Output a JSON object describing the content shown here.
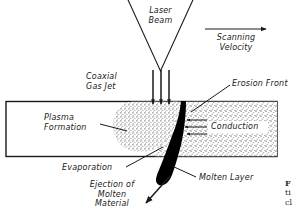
{
  "figure": {
    "type": "technical-schematic",
    "background_color": "#ffffff",
    "line_color": "#1a1a1a",
    "fill_molten_color": "#000000",
    "fill_stipple_color": "#b9b9b9",
    "labels": {
      "laser_beam": "Laser\nBeam",
      "laser_beam_line1": "Laser",
      "laser_beam_line2": "Beam",
      "scanning_velocity_line1": "Scanning",
      "scanning_velocity_line2": "Velocity",
      "coaxial_gas_jet_line1": "Coaxial",
      "coaxial_gas_jet_line2": "Gas Jet",
      "erosion_front": "Erosion Front",
      "plasma_formation_line1": "Plasma",
      "plasma_formation_line2": "Formation",
      "conduction": "Conduction",
      "evaporation": "Evaporation",
      "molten_layer": "Molten Layer",
      "ejection_line1": "Ejection of",
      "ejection_line2": "Molten",
      "ejection_line3": "Material"
    },
    "caption_fragment": {
      "line1": "F",
      "line2": "ti",
      "line3": "cl"
    }
  }
}
